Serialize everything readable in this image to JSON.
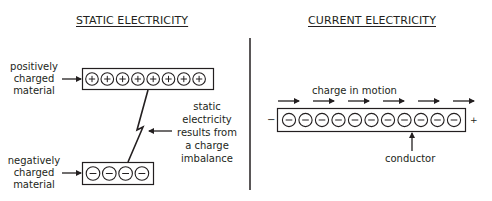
{
  "static": {
    "title": "STATIC ELECTRICITY",
    "positive_label": [
      "positively",
      "charged",
      "material"
    ],
    "negative_label": [
      "negatively",
      "charged",
      "material"
    ],
    "explanation": [
      "static",
      "electricity",
      "results from",
      "a charge",
      "imbalance"
    ],
    "positive_charge_count": 8,
    "negative_charge_count": 4,
    "positive_symbol": "+",
    "negative_symbol": "−"
  },
  "current": {
    "title": "CURRENT ELECTRICITY",
    "motion_label": "charge in motion",
    "conductor_label": "conductor",
    "left_terminal": "−",
    "right_terminal": "+",
    "charge_count": 11,
    "motion_arrow_count": 6,
    "charge_symbol": "−"
  },
  "colors": {
    "ink": "#231f20",
    "background": "#ffffff"
  }
}
